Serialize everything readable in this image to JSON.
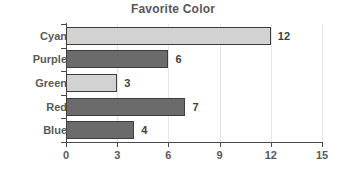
{
  "chart_data": {
    "type": "bar",
    "orientation": "horizontal",
    "title": "Favorite Color",
    "xlabel": "",
    "ylabel": "",
    "categories": [
      "Cyan",
      "Purple",
      "Green",
      "Red",
      "Blue"
    ],
    "values": [
      12,
      6,
      3,
      7,
      4
    ],
    "value_labels": [
      "12",
      "6",
      "3",
      "7",
      "4"
    ],
    "bar_styles": [
      "light",
      "dark",
      "light",
      "dark",
      "dark"
    ],
    "xlim": [
      0,
      15
    ],
    "xticks": [
      0,
      3,
      6,
      9,
      12,
      15
    ],
    "xtick_labels": [
      "0",
      "3",
      "6",
      "9",
      "12",
      "15"
    ],
    "grid": true,
    "legend": false
  },
  "colors": {
    "bar_light": "#d2d2d2",
    "bar_dark": "#6b6b6b",
    "bar_edge": "#3d3d3d",
    "axis": "#4a4a4a",
    "grid": "#e6e6e6",
    "title_text": "#575757",
    "label_text": "#5a5a5a",
    "value_text": "#3f3f3f",
    "background": "#ffffff"
  }
}
